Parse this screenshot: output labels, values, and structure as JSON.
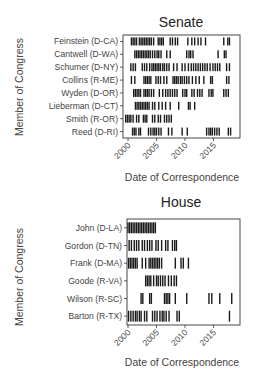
{
  "chart_data": [
    {
      "type": "event-plot",
      "title": "Senate",
      "xlabel": "Date of Correspondence",
      "ylabel": "Member of Congress",
      "xlim": [
        1999,
        2018.7
      ],
      "xticks": [
        2000,
        2005,
        2010,
        2015
      ],
      "grid": false,
      "rows": [
        {
          "label": "Feinstein (D-CA)",
          "events": [
            2000.6,
            2000.9,
            2001.2,
            2001.5,
            2002.0,
            2002.3,
            2002.6,
            2002.9,
            2003.2,
            2003.5,
            2003.8,
            2004.1,
            2004.5,
            2005.3,
            2005.6,
            2005.9,
            2006.2,
            2007.4,
            2007.8,
            2008.3,
            2008.7,
            2010.5,
            2011.2,
            2011.7,
            2012.3,
            2012.8,
            2013.6,
            2016.8,
            2017.5,
            2017.8
          ]
        },
        {
          "label": "Cantwell (D-WA)",
          "events": [
            2001.2,
            2001.5,
            2001.8,
            2002.1,
            2002.4,
            2002.7,
            2003.0,
            2003.3,
            2003.6,
            2003.9,
            2004.3,
            2004.7,
            2005.1,
            2005.4,
            2005.8,
            2006.8,
            2007.4,
            2010.3,
            2010.7,
            2011.0,
            2011.4,
            2015.8,
            2016.9,
            2017.2
          ]
        },
        {
          "label": "Schumer (D-NY)",
          "events": [
            2000.5,
            2000.9,
            2001.3,
            2002.5,
            2002.9,
            2003.3,
            2003.8,
            2004.2,
            2004.5,
            2004.8,
            2005.1,
            2005.4,
            2005.7,
            2006.1,
            2006.4,
            2006.8,
            2007.2,
            2008.0,
            2008.6,
            2009.5,
            2010.0,
            2010.6,
            2011.1,
            2011.5,
            2011.9,
            2012.3,
            2012.7,
            2013.1,
            2013.5,
            2013.9,
            2014.4,
            2014.9,
            2015.3,
            2015.7,
            2016.1,
            2017.3,
            2017.8
          ]
        },
        {
          "label": "Collins (R-ME)",
          "events": [
            2000.6,
            2001.2,
            2002.8,
            2003.1,
            2003.4,
            2003.7,
            2004.0,
            2004.9,
            2005.3,
            2005.7,
            2006.3,
            2006.8,
            2007.9,
            2008.2,
            2008.5,
            2008.8,
            2009.2,
            2009.5,
            2009.9,
            2010.3,
            2010.7,
            2011.3,
            2011.9,
            2012.5,
            2013.3,
            2014.5,
            2014.8,
            2017.3,
            2017.7
          ]
        },
        {
          "label": "Wyden (D-OR)",
          "events": [
            2001.0,
            2001.3,
            2001.6,
            2001.9,
            2002.2,
            2002.8,
            2003.1,
            2003.4,
            2003.7,
            2004.1,
            2004.5,
            2005.5,
            2006.1,
            2006.6,
            2007.0,
            2007.4,
            2007.8,
            2008.2,
            2008.6,
            2009.6,
            2010.0,
            2010.3,
            2011.2,
            2011.6,
            2012.2,
            2012.6,
            2013.0,
            2014.2,
            2014.6,
            2014.9,
            2016.8,
            2017.2,
            2017.6
          ]
        },
        {
          "label": "Lieberman (D-CT)",
          "events": [
            2001.3,
            2001.6,
            2001.9,
            2002.2,
            2002.5,
            2002.8,
            2003.1,
            2003.4,
            2003.7,
            2004.3,
            2004.7,
            2005.4,
            2006.0,
            2006.6,
            2007.4,
            2008.9,
            2010.6,
            2010.9,
            2011.7
          ]
        },
        {
          "label": "Smith (R-OR)",
          "events": [
            1999.6,
            1999.9,
            2000.2,
            2000.5,
            2000.9,
            2001.5,
            2001.9,
            2002.7,
            2003.0,
            2003.3,
            2004.3,
            2004.7,
            2005.3,
            2005.7,
            2006.4,
            2006.8,
            2007.2,
            2007.6
          ]
        },
        {
          "label": "Reed (D-RI)",
          "events": [
            2000.8,
            2001.1,
            2001.4,
            2001.9,
            2002.2,
            2003.6,
            2004.0,
            2004.4,
            2004.7,
            2005.0,
            2005.4,
            2005.8,
            2007.1,
            2007.7,
            2009.5,
            2010.4,
            2013.8,
            2014.2,
            2014.5,
            2014.8,
            2015.2,
            2015.6,
            2016.0,
            2017.6,
            2018.0
          ]
        }
      ]
    },
    {
      "type": "event-plot",
      "title": "House",
      "xlabel": "Date of Correspondence",
      "ylabel": "Member of Congress",
      "xlim": [
        1999.9,
        2018.7
      ],
      "xticks": [
        2000,
        2005,
        2010,
        2015
      ],
      "grid": false,
      "rows": [
        {
          "label": "John (D-LA)",
          "events": [
            2000.0,
            2000.3,
            2000.6,
            2000.9,
            2001.2,
            2001.5,
            2001.8,
            2002.1,
            2002.4,
            2002.7,
            2003.0,
            2003.3,
            2003.6,
            2003.9,
            2004.2,
            2004.5,
            2004.8
          ]
        },
        {
          "label": "Gordon (D-TN)",
          "events": [
            2000.2,
            2000.6,
            2001.1,
            2001.5,
            2001.9,
            2002.5,
            2002.9,
            2003.4,
            2003.8,
            2004.2,
            2004.9,
            2005.3,
            2005.9,
            2006.6,
            2007.0,
            2007.8,
            2008.2,
            2008.5
          ]
        },
        {
          "label": "Frank (D-MA)",
          "events": [
            2000.1,
            2000.4,
            2000.7,
            2001.0,
            2001.3,
            2001.6,
            2002.5,
            2003.1,
            2003.7,
            2004.0,
            2004.3,
            2004.6,
            2004.9,
            2005.2,
            2005.5,
            2005.9,
            2008.3,
            2009.3,
            2009.7,
            2010.6
          ]
        },
        {
          "label": "Goode (R-VA)",
          "events": [
            2003.1,
            2003.4,
            2003.7,
            2004.0,
            2004.5,
            2005.0,
            2005.3,
            2005.7,
            2006.1,
            2006.5,
            2007.1,
            2007.6,
            2008.1,
            2008.5
          ]
        },
        {
          "label": "Wilson (R-SC)",
          "events": [
            2002.3,
            2002.6,
            2003.8,
            2004.1,
            2006.4,
            2006.7,
            2007.0,
            2007.3,
            2008.3,
            2010.3,
            2014.2,
            2014.7,
            2016.1,
            2018.2
          ]
        },
        {
          "label": "Barton (R-TX)",
          "events": [
            2000.1,
            2000.5,
            2000.9,
            2001.3,
            2001.6,
            2002.0,
            2002.3,
            2002.9,
            2003.3,
            2004.3,
            2004.7,
            2005.1,
            2005.6,
            2006.0,
            2006.3,
            2006.7,
            2007.2,
            2008.6,
            2009.0,
            2017.8
          ]
        }
      ]
    }
  ],
  "panels": {
    "senate": {
      "title": "Senate",
      "ylabel": "Member of Congress",
      "xlabel": "Date of Correspondence",
      "ticks": [
        "2000",
        "2005",
        "2010",
        "2015"
      ]
    },
    "house": {
      "title": "House",
      "ylabel": "Member of Congress",
      "xlabel": "Date of Correspondence",
      "ticks": [
        "2000",
        "2005",
        "2010",
        "2015"
      ]
    }
  },
  "colors": {
    "event": "#1a1a1a",
    "frame": "#333333",
    "text": "#444444"
  }
}
